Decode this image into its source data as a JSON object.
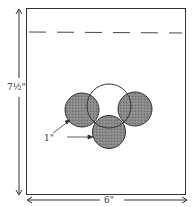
{
  "diagram": {
    "height_label": "7½\"",
    "width_label": "6\"",
    "circle_label": "1\"",
    "colors": {
      "line": "#333333",
      "fill": "#7a7a7a",
      "background": "#ffffff"
    }
  }
}
